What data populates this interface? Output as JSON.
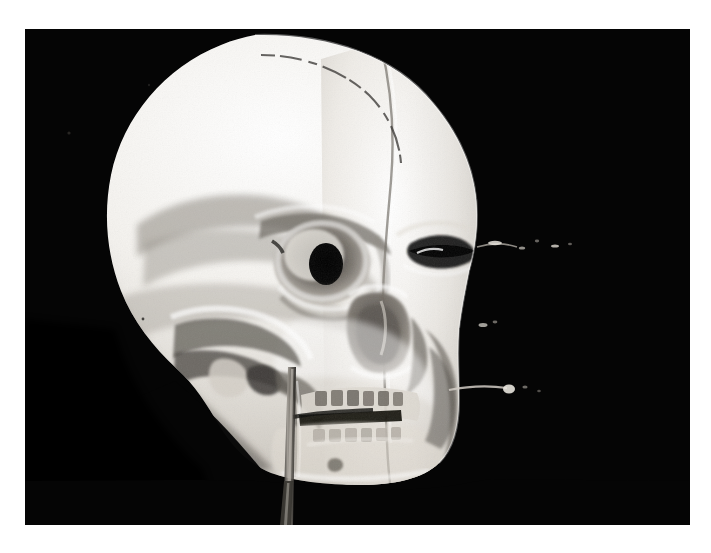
{
  "image": {
    "kind": "photograph",
    "subject": "human-skull",
    "description": "High-contrast black and white photograph of a human skull cast in three-quarter view",
    "orientation": "three-quarter right-facing",
    "background_color": "#050505",
    "page_color": "#ffffff",
    "bone_color": "#f2f0ec",
    "bone_shadow_color": "#8e8a84",
    "bone_deep_shadow_color": "#5a5650",
    "bone_highlight_color": "#ffffff",
    "cavity_color": "#0a0a0a",
    "frame": {
      "left": 25,
      "top": 29,
      "width": 665,
      "height": 496
    }
  },
  "features": [
    {
      "id": "cranial-vault",
      "label": "Cranial vault"
    },
    {
      "id": "coronal-suture",
      "label": "Coronal suture"
    },
    {
      "id": "sagittal-seam",
      "label": "Vertical cast seam"
    },
    {
      "id": "temporal-line",
      "label": "Temporal line shadow"
    },
    {
      "id": "left-orbit",
      "label": "Left eye orbit"
    },
    {
      "id": "right-orbit",
      "label": "Right eye orbit"
    },
    {
      "id": "brow-ridge",
      "label": "Supraorbital brow ridge"
    },
    {
      "id": "nasal-aperture",
      "label": "Nasal aperture"
    },
    {
      "id": "zygomatic-arch",
      "label": "Zygomatic arch"
    },
    {
      "id": "maxilla-teeth",
      "label": "Upper teeth row"
    },
    {
      "id": "mandible-teeth",
      "label": "Lower teeth row"
    },
    {
      "id": "mouth-line",
      "label": "Occlusal mouth line"
    },
    {
      "id": "mandible",
      "label": "Mandible and chin"
    },
    {
      "id": "support-rod",
      "label": "Mounting support rod"
    },
    {
      "id": "debris-specks",
      "label": "Bright debris specks"
    },
    {
      "id": "wire-whisker",
      "label": "Thin bright wire streak"
    }
  ],
  "annotations": {
    "frame_note": "",
    "title": ""
  }
}
